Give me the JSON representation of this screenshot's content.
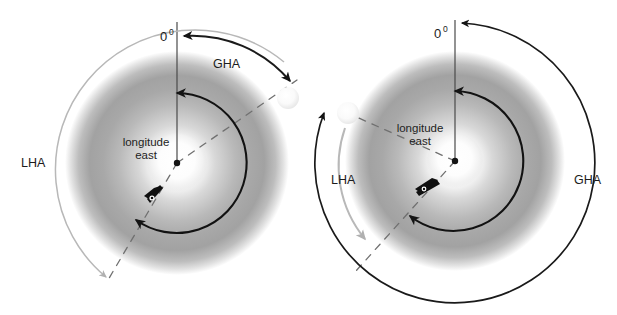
{
  "figure": {
    "background_color": "#ffffff",
    "width": 617,
    "height": 315
  },
  "colors": {
    "black_arc": "#1a1a1a",
    "gray_arc": "#b3b3b3",
    "dashed_meridian": "#6e6e6e",
    "globe_light": "#ffffff",
    "globe_mid": "#c9c9c9",
    "globe_dark": "#8d8d8d",
    "label_text": "#1c1c1c",
    "sun_body": "#f2f2f2"
  },
  "diagrams": [
    {
      "id": "left-diagram",
      "name": "gha-lha-east-longitude-sun-east-of-greenwich",
      "center": {
        "x": 177,
        "y": 163
      },
      "globe_radius": 110,
      "inner_pole_radius": 28,
      "labels": {
        "prime_meridian": {
          "text": "0",
          "superscript": "0",
          "x": 166,
          "y": 40
        },
        "gha": {
          "text": "GHA",
          "x": 229,
          "y": 64
        },
        "lha": {
          "text": "LHA",
          "x": 23,
          "y": 163
        },
        "longitude_line1": {
          "text": "longitude",
          "x": 146,
          "y": 145
        },
        "longitude_line2": {
          "text": "east",
          "x": 146,
          "y": 158
        }
      },
      "arcs": [
        {
          "name": "gha-arc-black",
          "color": "#1a1a1a",
          "from_deg": 55,
          "to_deg": 5,
          "radius": 128,
          "arrowheads": [
            "start",
            "end"
          ]
        },
        {
          "name": "longitude-east-arc-black",
          "color": "#1a1a1a",
          "from_deg": 0,
          "to_deg": 215,
          "radius": 68,
          "arrowheads": [
            "start",
            "end"
          ]
        },
        {
          "name": "lha-arc-gray",
          "color": "#b3b3b3",
          "from_deg": 52,
          "to_deg": 236,
          "radius": 133,
          "arrowheads": [
            "end"
          ]
        }
      ],
      "meridians": [
        {
          "name": "prime-meridian-line",
          "style": "solid",
          "angle_deg": 0
        },
        {
          "name": "body-meridian-dashed",
          "style": "dashed",
          "angle_deg": 55
        },
        {
          "name": "observer-meridian-dashed",
          "style": "dashed",
          "angle_deg": 236
        }
      ],
      "markers": [
        {
          "name": "celestial-body-sun",
          "x": 288,
          "y": 98,
          "radius": 11
        },
        {
          "name": "pole-center-dot",
          "x": 177,
          "y": 163,
          "radius": 3
        },
        {
          "name": "observer-ship-marker",
          "x": 152,
          "y": 200
        }
      ]
    },
    {
      "id": "right-diagram",
      "name": "gha-lha-east-longitude-sun-west-of-greenwich",
      "center": {
        "x": 455,
        "y": 161
      },
      "globe_radius": 108,
      "inner_pole_radius": 26,
      "labels": {
        "prime_meridian": {
          "text": "0",
          "superscript": "0",
          "x": 440,
          "y": 36
        },
        "gha": {
          "text": "GHA",
          "x": 576,
          "y": 180
        },
        "lha": {
          "text": "LHA",
          "x": 333,
          "y": 180
        },
        "longitude_line1": {
          "text": "longitude",
          "x": 420,
          "y": 131
        },
        "longitude_line2": {
          "text": "east",
          "x": 420,
          "y": 144
        }
      },
      "arcs": [
        {
          "name": "gha-arc-black",
          "color": "#1a1a1a",
          "from_deg": 3,
          "to_deg": 297,
          "radius": 138,
          "arrowheads": [
            "start",
            "end"
          ]
        },
        {
          "name": "longitude-east-arc-black",
          "color": "#1a1a1a",
          "from_deg": 0,
          "to_deg": 218,
          "radius": 68,
          "arrowheads": [
            "start",
            "end"
          ]
        },
        {
          "name": "lha-arc-gray",
          "color": "#b3b3b3",
          "from_deg": 295,
          "to_deg": 238,
          "radius": 112,
          "arrowheads": [
            "end"
          ]
        }
      ],
      "meridians": [
        {
          "name": "prime-meridian-line",
          "style": "solid",
          "angle_deg": 0
        },
        {
          "name": "body-meridian-dashed",
          "style": "dashed",
          "angle_deg": 297
        },
        {
          "name": "observer-meridian-dashed",
          "style": "dashed",
          "angle_deg": 238
        }
      ],
      "markers": [
        {
          "name": "celestial-body-sun",
          "x": 348,
          "y": 113,
          "radius": 11
        },
        {
          "name": "pole-center-dot",
          "x": 455,
          "y": 161,
          "radius": 3
        },
        {
          "name": "observer-ship-marker",
          "x": 422,
          "y": 192
        }
      ]
    }
  ]
}
